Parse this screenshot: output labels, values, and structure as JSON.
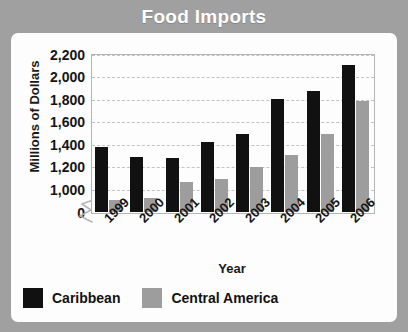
{
  "card": {
    "title": "Food Imports",
    "header_bg": "#a0a0a0",
    "panel_bg": "#fdfdfd"
  },
  "chart_data": {
    "type": "bar",
    "title": "Food Imports",
    "xlabel": "Year",
    "ylabel": "Millions of Dollars",
    "categories": [
      "1999",
      "2000",
      "2001",
      "2002",
      "2003",
      "2004",
      "2005",
      "2006"
    ],
    "series": [
      {
        "name": "Caribbean",
        "color": "#111111",
        "values": [
          1490,
          1420,
          1410,
          1530,
          1590,
          1860,
          1920,
          2120
        ]
      },
      {
        "name": "Central America",
        "color": "#9d9d9d",
        "values": [
          1090,
          1110,
          1230,
          1250,
          1340,
          1430,
          1590,
          1840
        ]
      }
    ],
    "ytick_labels": [
      "2,200",
      "2,000",
      "1,800",
      "1,600",
      "1,400",
      "1,200",
      "1,000",
      "0"
    ],
    "ytick_values": [
      2200,
      2000,
      1800,
      1600,
      1400,
      1200,
      1000,
      0
    ],
    "ylim": [
      1000,
      2200
    ],
    "y_axis_break": true,
    "y_axis_break_icon": "zigzag-break-icon",
    "grid": true,
    "grid_style": "dashed-horizontal",
    "legend_position": "bottom-left",
    "xtick_rotation_degrees": -45
  },
  "legend": {
    "items": [
      {
        "label": "Caribbean",
        "color": "#111111"
      },
      {
        "label": "Central America",
        "color": "#9d9d9d"
      }
    ]
  }
}
